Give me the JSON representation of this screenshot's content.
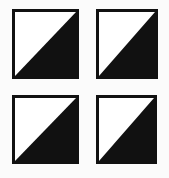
{
  "figure": {
    "background_color": "#fbfbfb",
    "rows": 2,
    "columns": 4
  },
  "palette": {
    "fill_black": "#111111",
    "fill_white": "#ffffff",
    "border_color": "#111111",
    "page_background": "#fbfbfb"
  },
  "tiles": [
    {
      "id": "tile-top-left",
      "row": 0,
      "column": 0,
      "label": "Tile 1",
      "diagonal": "bottom-left-to-top-right",
      "filled_half": "lower-right",
      "empty_half": "upper-left",
      "fill_color": "#111111",
      "empty_color": "#ffffff",
      "border_color": "#111111",
      "border_width_px": 3,
      "x": 12,
      "y": 9,
      "width": 67,
      "height": 70
    },
    {
      "id": "tile-top-right",
      "row": 0,
      "column": 1,
      "label": "Tile 2",
      "diagonal": "bottom-left-to-top-right",
      "filled_half": "lower-right",
      "empty_half": "upper-left",
      "fill_color": "#111111",
      "empty_color": "#ffffff",
      "border_color": "#111111",
      "border_width_px": 3,
      "x": 96,
      "y": 9,
      "width": 62,
      "height": 70
    },
    {
      "id": "tile-bottom-left",
      "row": 1,
      "column": 0,
      "label": "Tile 3",
      "diagonal": "bottom-left-to-top-right",
      "filled_half": "lower-right",
      "empty_half": "upper-left",
      "fill_color": "#111111",
      "empty_color": "#ffffff",
      "border_color": "#111111",
      "border_width_px": 3,
      "x": 12,
      "y": 95,
      "width": 67,
      "height": 69
    },
    {
      "id": "tile-bottom-right",
      "row": 1,
      "column": 1,
      "label": "Tile 4",
      "diagonal": "bottom-left-to-top-right",
      "filled_half": "lower-right",
      "empty_half": "upper-left",
      "fill_color": "#111111",
      "empty_color": "#ffffff",
      "border_color": "#111111",
      "border_width_px": 3,
      "x": 96,
      "y": 95,
      "width": 61,
      "height": 69
    }
  ]
}
